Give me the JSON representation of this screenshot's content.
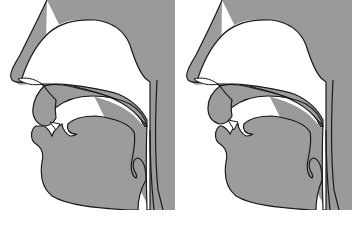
{
  "figure": {
    "type": "midsagittal vocal tract diagrams",
    "panels": [
      {
        "id": "left",
        "structures": [
          "nose",
          "nasal-cavity",
          "hard-palate",
          "velum",
          "upper-lip",
          "lower-lip",
          "teeth",
          "tongue",
          "pharynx",
          "epiglottis",
          "pharyngeal-wall"
        ]
      },
      {
        "id": "right",
        "structures": [
          "nose",
          "nasal-cavity",
          "hard-palate",
          "velum",
          "upper-lip",
          "lower-lip",
          "teeth",
          "tongue",
          "pharynx",
          "epiglottis",
          "pharyngeal-wall"
        ]
      }
    ],
    "colors": {
      "fill": "#9a9a9a",
      "outline": "#1a1a1a",
      "background": "#ffffff"
    },
    "caption": ""
  }
}
